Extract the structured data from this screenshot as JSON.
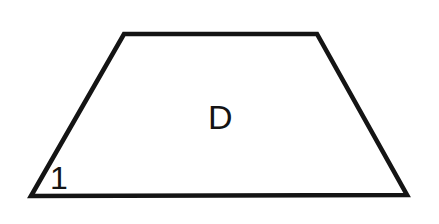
{
  "figure": {
    "kind": "geometry-diagram",
    "shape_name": "trapezoid",
    "canvas": {
      "width": 439,
      "height": 224,
      "background_color": "#ffffff"
    },
    "stroke": {
      "color": "#141414",
      "width_px": 4.6
    },
    "vertices": [
      {
        "name": "top-left",
        "x": 124,
        "y": 34
      },
      {
        "name": "top-right",
        "x": 317,
        "y": 34
      },
      {
        "name": "bottom-right",
        "x": 407,
        "y": 195
      },
      {
        "name": "bottom-left",
        "x": 31,
        "y": 196
      }
    ],
    "polygon_points": "124,34 317,34 407,195 31,196",
    "edges": [
      {
        "name": "top-base",
        "from": "top-left",
        "to": "top-right"
      },
      {
        "name": "right-leg",
        "from": "top-right",
        "to": "bottom-right"
      },
      {
        "name": "bottom-base",
        "from": "bottom-right",
        "to": "bottom-left"
      },
      {
        "name": "left-leg",
        "from": "bottom-left",
        "to": "top-left"
      }
    ],
    "labels": {
      "interior": {
        "text": "D",
        "role": "region-label",
        "x": 221,
        "y": 118,
        "color": "#141414"
      },
      "angle": {
        "text": "1",
        "role": "angle-label",
        "at_vertex": "bottom-left",
        "x": 57,
        "y": 179,
        "color": "#141414"
      }
    }
  }
}
